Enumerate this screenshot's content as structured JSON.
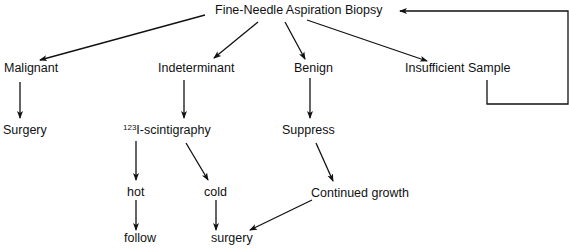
{
  "diagram": {
    "title": "Fine-Needle Aspiration Biopsy",
    "colors": {
      "line": "#111111",
      "text": "#111111",
      "background": "#ffffff"
    },
    "nodes": {
      "root": "Fine-Needle Aspiration Biopsy",
      "malignant": "Malignant",
      "indeterminant": "Indeterminant",
      "benign": "Benign",
      "insufficient": "Insufficient Sample",
      "surgery_malignant": "Surgery",
      "scintigraphy_sup": "123",
      "scintigraphy": "I-scintigraphy",
      "suppress": "Suppress",
      "hot": "hot",
      "cold": "cold",
      "continued_growth": "Continued growth",
      "follow": "follow",
      "surgery_final": "surgery"
    },
    "edges": [
      {
        "from": "Fine-Needle Aspiration Biopsy",
        "to": "Malignant"
      },
      {
        "from": "Fine-Needle Aspiration Biopsy",
        "to": "Indeterminant"
      },
      {
        "from": "Fine-Needle Aspiration Biopsy",
        "to": "Benign"
      },
      {
        "from": "Fine-Needle Aspiration Biopsy",
        "to": "Insufficient Sample"
      },
      {
        "from": "Insufficient Sample",
        "to": "Fine-Needle Aspiration Biopsy",
        "type": "feedback-loop"
      },
      {
        "from": "Malignant",
        "to": "Surgery"
      },
      {
        "from": "Indeterminant",
        "to": "123I-scintigraphy"
      },
      {
        "from": "Benign",
        "to": "Suppress"
      },
      {
        "from": "123I-scintigraphy",
        "to": "hot"
      },
      {
        "from": "123I-scintigraphy",
        "to": "cold"
      },
      {
        "from": "Suppress",
        "to": "Continued growth"
      },
      {
        "from": "hot",
        "to": "follow"
      },
      {
        "from": "cold",
        "to": "surgery"
      },
      {
        "from": "Continued growth",
        "to": "surgery"
      }
    ]
  }
}
